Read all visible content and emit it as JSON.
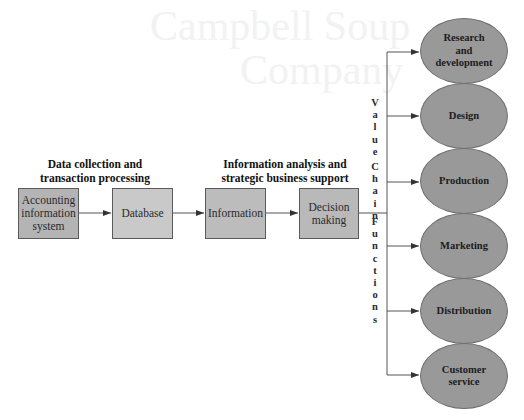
{
  "background_ghost_text": {
    "line1": "Campbell Soup",
    "line2": "Company"
  },
  "sections": {
    "left_label": [
      "Data collection and",
      "transaction processing"
    ],
    "right_label": [
      "Information analysis and",
      "strategic business support"
    ]
  },
  "process_boxes": [
    {
      "id": "accounting-information-system",
      "lines": [
        "Accounting",
        "information",
        "system"
      ],
      "fill": "#b4b4b4"
    },
    {
      "id": "database",
      "lines": [
        "Database"
      ],
      "fill": "#c9c9c9"
    },
    {
      "id": "information",
      "lines": [
        "Information"
      ],
      "fill": "#bcbcbc"
    },
    {
      "id": "decision-making",
      "lines": [
        "Decision",
        "making"
      ],
      "fill": "#b9b9b9"
    }
  ],
  "spine_label": {
    "word1": [
      "V",
      "a",
      "l",
      "u",
      "e"
    ],
    "word2": [
      "C",
      "h",
      "a",
      "i",
      "n"
    ],
    "word3": [
      "F",
      "u",
      "n",
      "c",
      "t",
      "i",
      "o",
      "n",
      "s"
    ]
  },
  "value_chain_functions": [
    {
      "lines": [
        "Research",
        "and",
        "development"
      ]
    },
    {
      "lines": [
        "Design"
      ]
    },
    {
      "lines": [
        "Production"
      ]
    },
    {
      "lines": [
        "Marketing"
      ]
    },
    {
      "lines": [
        "Distribution"
      ]
    },
    {
      "lines": [
        "Customer",
        "service"
      ]
    }
  ],
  "colors": {
    "ellipse_fill": "#999999",
    "line": "#555555",
    "text": "#1a1a1a"
  }
}
